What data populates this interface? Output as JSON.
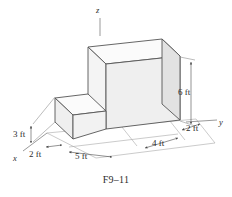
{
  "figure": {
    "caption": "F9–11",
    "axes": {
      "x_label": "x",
      "y_label": "y",
      "z_label": "z"
    },
    "dimensions": [
      {
        "id": "height-small-block",
        "label": "3 ft",
        "value": 3,
        "unit": "ft"
      },
      {
        "id": "depth-small-block",
        "label": "2 ft",
        "value": 2,
        "unit": "ft"
      },
      {
        "id": "length-small-block",
        "label": "5 ft",
        "value": 5,
        "unit": "ft"
      },
      {
        "id": "length-large-block",
        "label": "4 ft",
        "value": 4,
        "unit": "ft"
      },
      {
        "id": "depth-large-block",
        "label": "2 ft",
        "value": 2,
        "unit": "ft"
      },
      {
        "id": "height-large-block",
        "label": "6 ft",
        "value": 6,
        "unit": "ft"
      }
    ],
    "colors": {
      "outline": "#555555",
      "thin_line": "#9a9a9a",
      "face_front": "#f2f2f2",
      "face_top": "#fbfbfb",
      "face_side": "#e2e2e2",
      "text": "#2b2b2b"
    }
  }
}
